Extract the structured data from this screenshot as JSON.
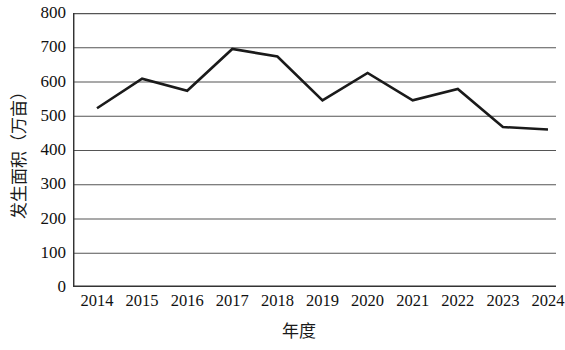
{
  "chart_data": {
    "type": "line",
    "title": "",
    "subtitle": "",
    "xlabel": "年度",
    "ylabel": "发生面积（万亩）",
    "categories": [
      "2014",
      "2015",
      "2016",
      "2017",
      "2018",
      "2019",
      "2020",
      "2021",
      "2022",
      "2023",
      "2024"
    ],
    "values": [
      522,
      608,
      573,
      695,
      673,
      545,
      625,
      545,
      578,
      467,
      460
    ],
    "series": [
      {
        "name": "发生面积",
        "values": [
          522,
          608,
          573,
          695,
          673,
          545,
          625,
          545,
          578,
          467,
          460
        ]
      }
    ],
    "x": [
      2014,
      2015,
      2016,
      2017,
      2018,
      2019,
      2020,
      2021,
      2022,
      2023,
      2024
    ],
    "ylim": [
      0,
      800
    ],
    "yticks": [
      0,
      100,
      200,
      300,
      400,
      500,
      600,
      700,
      800
    ],
    "ytick_labels": [
      "0",
      "100",
      "200",
      "300",
      "400",
      "500",
      "600",
      "700",
      "800"
    ],
    "xtick_labels": [
      "2014",
      "2015",
      "2016",
      "2017",
      "2018",
      "2019",
      "2020",
      "2021",
      "2022",
      "2023",
      "2024"
    ],
    "grid": true,
    "grid_axis": "y",
    "legend": false,
    "legend_position": "none",
    "line_color": "#1a1a1a",
    "grid_color": "#555555",
    "axis_color": "#333333",
    "background_color": "#ffffff",
    "markers": false
  }
}
